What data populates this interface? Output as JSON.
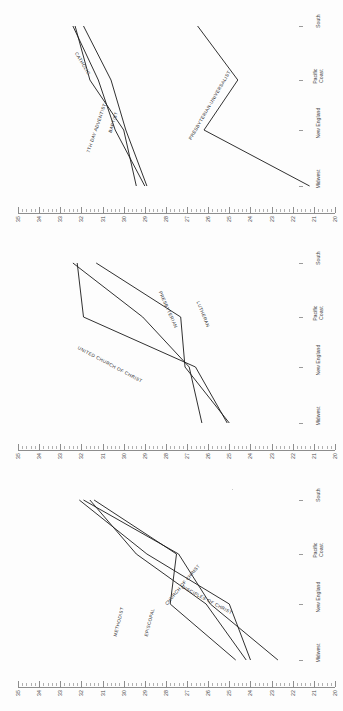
{
  "figure": {
    "background": "#fdfdfd",
    "line_color": "#1a1a1a",
    "axis_color": "#8d8d8d",
    "text_color": "#3f3f3f",
    "orientation": "rotated-90",
    "panel_count": 3
  },
  "axis": {
    "categories": [
      "Midwest",
      "New England",
      "Pacific\nCoast",
      "South"
    ],
    "category_labels_flat": [
      "Midwest",
      "New England",
      "Pacific Coast",
      "South"
    ],
    "tick_labels": [
      "35",
      "34",
      "33",
      "32",
      "31",
      "30",
      "29",
      "28",
      "27",
      "26",
      "25",
      "24",
      "23",
      "22",
      "21",
      "20"
    ],
    "value_min": 20,
    "value_max": 35,
    "minor_ticks_per_major": 4
  },
  "chart_data": {
    "type": "line",
    "title": "",
    "subtitle": "",
    "xlabel": "",
    "ylabel": "",
    "x": [
      "Midwest",
      "New England",
      "Pacific Coast",
      "South"
    ],
    "ylim": [
      20,
      35
    ],
    "grid": false,
    "legend": "inline-labels",
    "panels": [
      {
        "index": 1,
        "series": [
          {
            "name": "CATHOLIC",
            "values": [
              29.4,
              30.0,
              31.6,
              32.3
            ]
          },
          {
            "name": "7TH DAY ADVENTIST",
            "values": [
              29.0,
              30.4,
              31.2,
              32.4
            ]
          },
          {
            "name": "BAPTIST",
            "values": [
              28.9,
              29.9,
              30.6,
              31.9
            ]
          },
          {
            "name": "PRESBYTERIAN-UNIVERSALIST",
            "values": [
              21.2,
              26.2,
              24.6,
              26.5
            ]
          }
        ]
      },
      {
        "index": 2,
        "series": [
          {
            "name": "UNITED CHURCH OF CHRIST",
            "values": [
              25.1,
              26.6,
              31.9,
              32.2
            ]
          },
          {
            "name": "PRESBYTERIAN",
            "values": [
              25.0,
              27.1,
              27.3,
              31.3
            ]
          },
          {
            "name": "LUTHERAN",
            "values": [
              26.3,
              26.9,
              29.1,
              32.4
            ]
          }
        ]
      },
      {
        "index": 3,
        "series": [
          {
            "name": "METHODIST",
            "values": [
              24.7,
              27.8,
              27.5,
              31.4
            ]
          },
          {
            "name": "EPISCOPAL",
            "values": [
              24.2,
              26.1,
              29.4,
              31.6
            ]
          },
          {
            "name": "CHURCH OF CHRIST",
            "values": [
              24.0,
              25.0,
              28.9,
              32.1
            ]
          },
          {
            "name": "DISCIPLES OF CHRIST",
            "values": [
              22.7,
              25.9,
              27.4,
              31.9
            ]
          }
        ]
      }
    ]
  }
}
